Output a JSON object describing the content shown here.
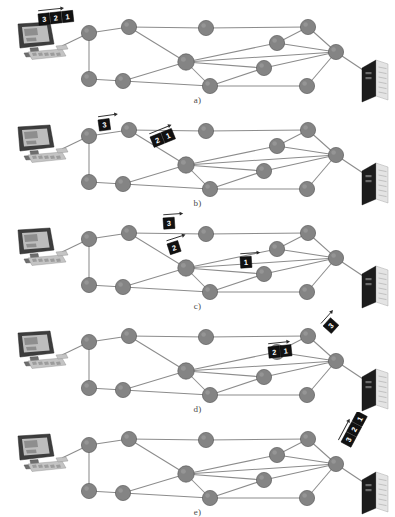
{
  "figure": {
    "width": 395,
    "height": 515,
    "background_color": "#ffffff",
    "node_color": "#848484",
    "edge_color": "#8c8c8c",
    "packet_color": "#111111",
    "packet_text_color": "#ffffff"
  },
  "panels": [
    {
      "id": "a",
      "caption": "a)",
      "caption_x": 197,
      "caption_y": 95,
      "top": 0,
      "packets": [
        {
          "labels": [
            "3",
            "2",
            "1"
          ],
          "x": 38,
          "y": 14,
          "rotate": -6,
          "arrow": true,
          "arrow_dx": 26
        }
      ]
    },
    {
      "id": "b",
      "caption": "b)",
      "caption_x": 197,
      "caption_y": 95,
      "top": 103,
      "packets": [
        {
          "labels": [
            "3"
          ],
          "x": 98,
          "y": 17,
          "rotate": -8,
          "arrow": true,
          "arrow_dx": 20
        },
        {
          "labels": [
            "2",
            "1"
          ],
          "x": 150,
          "y": 34,
          "rotate": -22,
          "arrow": true,
          "arrow_dx": 24
        }
      ]
    },
    {
      "id": "c",
      "caption": "c)",
      "caption_x": 197,
      "caption_y": 95,
      "top": 206,
      "packets": [
        {
          "labels": [
            "3"
          ],
          "x": 163,
          "y": 12,
          "rotate": -4,
          "arrow": true,
          "arrow_dx": 20
        },
        {
          "labels": [
            "2"
          ],
          "x": 167,
          "y": 38,
          "rotate": -18,
          "arrow": true,
          "arrow_dx": 20
        },
        {
          "labels": [
            "1"
          ],
          "x": 240,
          "y": 51,
          "rotate": -4,
          "arrow": true,
          "arrow_dx": 20
        }
      ]
    },
    {
      "id": "d",
      "caption": "d)",
      "caption_x": 197,
      "caption_y": 95,
      "top": 309,
      "packets": [
        {
          "labels": [
            "3"
          ],
          "x": 323,
          "y": 17,
          "rotate": -48,
          "arrow": true,
          "arrow_dx": 18
        },
        {
          "labels": [
            "2",
            "1"
          ],
          "x": 268,
          "y": 38,
          "rotate": -6,
          "arrow": true,
          "arrow_dx": 22
        }
      ]
    },
    {
      "id": "e",
      "caption": "e)",
      "caption_x": 197,
      "caption_y": 95,
      "top": 412,
      "packets": [
        {
          "labels": [
            "3",
            "2",
            "1"
          ],
          "x": 341,
          "y": 30,
          "rotate": -62,
          "arrow": true,
          "arrow_dx": 24
        }
      ]
    }
  ],
  "network": {
    "nodes": [
      {
        "name": "node-1",
        "x": 89,
        "y": 33,
        "r": 7.6
      },
      {
        "name": "node-2",
        "x": 129,
        "y": 27,
        "r": 7.6
      },
      {
        "name": "node-3",
        "x": 206,
        "y": 28,
        "r": 7.6
      },
      {
        "name": "node-4",
        "x": 308,
        "y": 27,
        "r": 7.6
      },
      {
        "name": "node-5",
        "x": 277,
        "y": 43,
        "r": 7.6
      },
      {
        "name": "node-6",
        "x": 336,
        "y": 52,
        "r": 7.6
      },
      {
        "name": "node-7",
        "x": 186,
        "y": 62,
        "r": 8.2
      },
      {
        "name": "node-8",
        "x": 264,
        "y": 68,
        "r": 7.6
      },
      {
        "name": "node-9",
        "x": 89,
        "y": 79,
        "r": 7.6
      },
      {
        "name": "node-10",
        "x": 123,
        "y": 81,
        "r": 7.6
      },
      {
        "name": "node-11",
        "x": 210,
        "y": 86,
        "r": 7.6
      },
      {
        "name": "node-12",
        "x": 307,
        "y": 86,
        "r": 7.6
      }
    ],
    "edges": [
      [
        "node-1",
        "node-2"
      ],
      [
        "node-1",
        "node-9"
      ],
      [
        "node-2",
        "node-3"
      ],
      [
        "node-2",
        "node-7"
      ],
      [
        "node-3",
        "node-4"
      ],
      [
        "node-4",
        "node-5"
      ],
      [
        "node-4",
        "node-6"
      ],
      [
        "node-5",
        "node-6"
      ],
      [
        "node-5",
        "node-7"
      ],
      [
        "node-6",
        "node-7"
      ],
      [
        "node-6",
        "node-8"
      ],
      [
        "node-6",
        "node-12"
      ],
      [
        "node-7",
        "node-8"
      ],
      [
        "node-7",
        "node-10"
      ],
      [
        "node-7",
        "node-11"
      ],
      [
        "node-8",
        "node-11"
      ],
      [
        "node-9",
        "node-10"
      ],
      [
        "node-10",
        "node-11"
      ],
      [
        "node-11",
        "node-12"
      ]
    ],
    "source_device": {
      "name": "desktop-computer",
      "x": 16,
      "y": 22
    },
    "destination_device": {
      "name": "server-tower",
      "x": 362,
      "y": 60
    },
    "source_link": {
      "from_x": 62,
      "from_y": 46,
      "to_node": "node-1"
    },
    "destination_link": {
      "from_node": "node-6",
      "to_x": 366,
      "to_y": 72
    }
  }
}
